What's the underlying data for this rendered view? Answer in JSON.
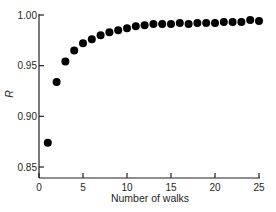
{
  "chart_data": {
    "type": "scatter",
    "title": "",
    "xlabel": "Number of walks",
    "ylabel": "R",
    "xlim": [
      0,
      25
    ],
    "ylim": [
      0.85,
      1.0
    ],
    "x_ticks": [
      0,
      5,
      10,
      15,
      20,
      25
    ],
    "x_tick_labels": [
      "0",
      "5",
      "10",
      "15",
      "20",
      "25"
    ],
    "y_ticks": [
      0.85,
      0.9,
      0.95,
      1.0
    ],
    "y_tick_labels": [
      "0.85",
      "0.90",
      "0.95",
      "1.00"
    ],
    "grid": false,
    "legend": null,
    "marker_color": "#000000",
    "series": [
      {
        "name": "R",
        "x": [
          1,
          2,
          3,
          4,
          5,
          6,
          7,
          8,
          9,
          10,
          11,
          12,
          13,
          14,
          15,
          16,
          17,
          18,
          19,
          20,
          21,
          22,
          23,
          24,
          25
        ],
        "values": [
          0.874,
          0.934,
          0.954,
          0.965,
          0.972,
          0.976,
          0.98,
          0.983,
          0.985,
          0.987,
          0.989,
          0.99,
          0.991,
          0.991,
          0.991,
          0.992,
          0.991,
          0.992,
          0.992,
          0.992,
          0.993,
          0.993,
          0.993,
          0.995,
          0.994
        ]
      }
    ]
  }
}
